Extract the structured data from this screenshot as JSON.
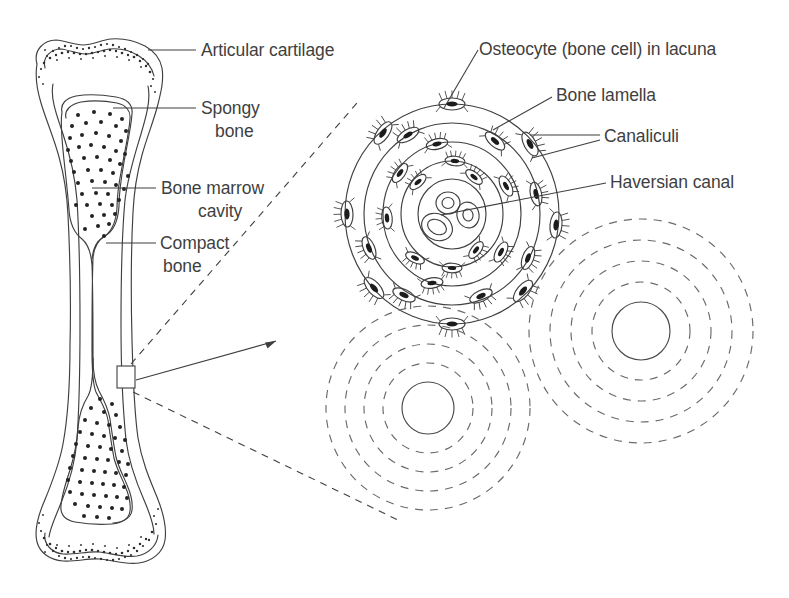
{
  "figure": {
    "background_color": "#ffffff",
    "ink_color": "#3f3f3f",
    "text_color": "#3f3f3f"
  },
  "labels": {
    "articular_cartilage": "Articular cartilage",
    "spongy_bone_line1": "Spongy",
    "spongy_bone_line2": "bone",
    "bone_marrow_cavity_line1": "Bone marrow",
    "bone_marrow_cavity_line2": "cavity",
    "compact_bone_line1": "Compact",
    "compact_bone_line2": "bone",
    "osteocyte_in_lacuna": "Osteocyte (bone cell) in lacuna",
    "bone_lamella": "Bone lamella",
    "canaliculi": "Canaliculi",
    "haversian_canal": "Haversian canal"
  },
  "diagram_parts": {
    "long_bone": {
      "name": "long-bone-longitudinal-section",
      "regions": [
        "articular cartilage cap (stippled) at proximal and distal ends",
        "spongy bone (trabecular, dotted) inside both epiphyses",
        "bone marrow cavity (medullary cavity) in the shaft",
        "compact bone forming the shaft walls"
      ]
    },
    "haversian_system": {
      "name": "haversian-system-osteon",
      "lamellae_ring_count": 5,
      "osteocyte_count": 26,
      "central_canal_vessel_count": 3,
      "description": "Osteon shown in cross-section with concentric bone lamellae, osteocytes in lacunae bearing radiating canaliculi, and a central Haversian canal containing blood vessels"
    },
    "partial_osteons": {
      "name": "adjacent-osteons-dashed",
      "count": 2,
      "dashed_ring_count": 4,
      "description": "Neighbouring osteons drawn with dashed lamellae and a solid central Haversian canal"
    },
    "magnification_callout": {
      "name": "magnification-callout",
      "description": "Small rectangle on the compact bone of the shaft with a solid arrow and two dashed guide lines expanding to the Haversian system"
    }
  }
}
